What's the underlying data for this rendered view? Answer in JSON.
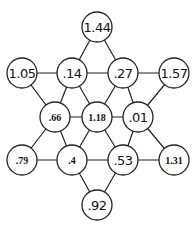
{
  "diagram": {
    "type": "hexagram-graph",
    "node_radius": 15,
    "nodes": [
      {
        "id": "n1",
        "label": "1.44",
        "x": 97,
        "y": 27,
        "style": "hand"
      },
      {
        "id": "n2",
        "label": "1.05",
        "x": 22,
        "y": 73,
        "style": "hand"
      },
      {
        "id": "n3",
        "label": ".14",
        "x": 72,
        "y": 73,
        "style": "hand"
      },
      {
        "id": "n4",
        "label": ".27",
        "x": 123,
        "y": 73,
        "style": "hand"
      },
      {
        "id": "n5",
        "label": "1.57",
        "x": 174,
        "y": 73,
        "style": "hand"
      },
      {
        "id": "n6",
        "label": ".66",
        "x": 55,
        "y": 117,
        "style": "print"
      },
      {
        "id": "n7",
        "label": "1.18",
        "x": 97,
        "y": 117,
        "style": "print"
      },
      {
        "id": "n8",
        "label": ".01",
        "x": 138,
        "y": 117,
        "style": "hand"
      },
      {
        "id": "n9",
        "label": ".79",
        "x": 22,
        "y": 160,
        "style": "print"
      },
      {
        "id": "n10",
        "label": ".4",
        "x": 72,
        "y": 160,
        "style": "print"
      },
      {
        "id": "n11",
        "label": ".53",
        "x": 123,
        "y": 160,
        "style": "hand"
      },
      {
        "id": "n12",
        "label": "1.31",
        "x": 174,
        "y": 160,
        "style": "print"
      },
      {
        "id": "n13",
        "label": ".92",
        "x": 97,
        "y": 205,
        "style": "hand"
      }
    ],
    "edges": [
      [
        "n1",
        "n3"
      ],
      [
        "n1",
        "n4"
      ],
      [
        "n2",
        "n3"
      ],
      [
        "n3",
        "n4"
      ],
      [
        "n4",
        "n5"
      ],
      [
        "n2",
        "n6"
      ],
      [
        "n3",
        "n6"
      ],
      [
        "n3",
        "n7"
      ],
      [
        "n4",
        "n7"
      ],
      [
        "n4",
        "n8"
      ],
      [
        "n5",
        "n8"
      ],
      [
        "n6",
        "n7"
      ],
      [
        "n7",
        "n8"
      ],
      [
        "n6",
        "n9"
      ],
      [
        "n6",
        "n10"
      ],
      [
        "n7",
        "n10"
      ],
      [
        "n7",
        "n11"
      ],
      [
        "n8",
        "n11"
      ],
      [
        "n8",
        "n12"
      ],
      [
        "n9",
        "n10"
      ],
      [
        "n10",
        "n11"
      ],
      [
        "n11",
        "n12"
      ],
      [
        "n10",
        "n13"
      ],
      [
        "n11",
        "n13"
      ]
    ]
  }
}
